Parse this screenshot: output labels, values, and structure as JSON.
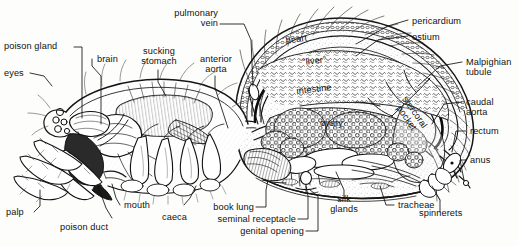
{
  "figure": {
    "view": "longitudinal sagittal section",
    "style": "black-and-white pen-and-ink line drawing",
    "background_color": "#fdfdfc",
    "ink_color": "#111111",
    "width": 519,
    "height": 246
  },
  "labels": {
    "poison_gland": "poison gland",
    "eyes": "eyes",
    "brain": "brain",
    "sucking_stomach": "sucking\nstomach",
    "anterior_aorta": "anterior\naorta",
    "pulmonary_vein": "pulmonary\nvein",
    "heart": "heart",
    "pericardium": "pericardium",
    "ostium": "ostium",
    "malpighian_tubule": "Malpighian\ntubule",
    "caudal_aorta": "caudal\naorta",
    "rectum": "rectum",
    "anus": "anus",
    "liver": "“liver”",
    "intestine": "intestine",
    "ovary": "ovary",
    "stercoral_pocket": "stercoral\npocket",
    "spinnerets": "spinnerets",
    "tracheae": "tracheae",
    "silk_glands": "silk\nglands",
    "genital_opening": "genital opening",
    "seminal_receptacle": "seminal receptacle",
    "book_lung": "book lung",
    "caeca": "caeca",
    "mouth": "mouth",
    "poison_duct": "poison duct",
    "palp": "palp"
  }
}
